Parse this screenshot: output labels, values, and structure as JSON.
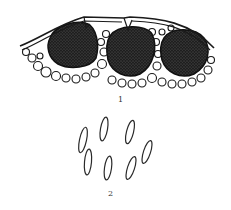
{
  "figure": {
    "panels": [
      {
        "id": "1",
        "label": "1",
        "description": "cross-section with three dark rounded bodies embedded beneath a curved outer layer, surrounded by pale cells",
        "body_count": 3
      },
      {
        "id": "2",
        "label": "2",
        "description": "seven elongated elliptical spores outlined",
        "spore_count": 7
      }
    ],
    "colors": {
      "ink": "#1a1a1a",
      "dark_fill": "#222222",
      "background": "#ffffff"
    }
  }
}
